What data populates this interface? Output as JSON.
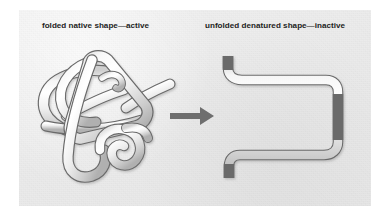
{
  "figure": {
    "panel_background": "#eeeeee",
    "page_background": "#ffffff"
  },
  "captions": {
    "folded": "folded native shape—active",
    "unfolded": "unfolded denatured shape—inactive",
    "text_color": "#1d1d1d"
  },
  "diagram": {
    "left_shape": {
      "name": "folded-native-protein",
      "description": "tangled knotted tube representing a folded native protein"
    },
    "right_shape": {
      "name": "unfolded-denatured-protein",
      "description": "open C-shaped bracket tube representing an unfolded denatured protein chain"
    },
    "arrow": {
      "name": "transition-arrow",
      "direction": "right",
      "color": "#6e6e6e"
    },
    "tube": {
      "fill_light": "#ffffff",
      "fill_mid": "#f2f2f2",
      "fill_shadow": "#b9b9b9",
      "outline": "#6a6a6a"
    }
  }
}
